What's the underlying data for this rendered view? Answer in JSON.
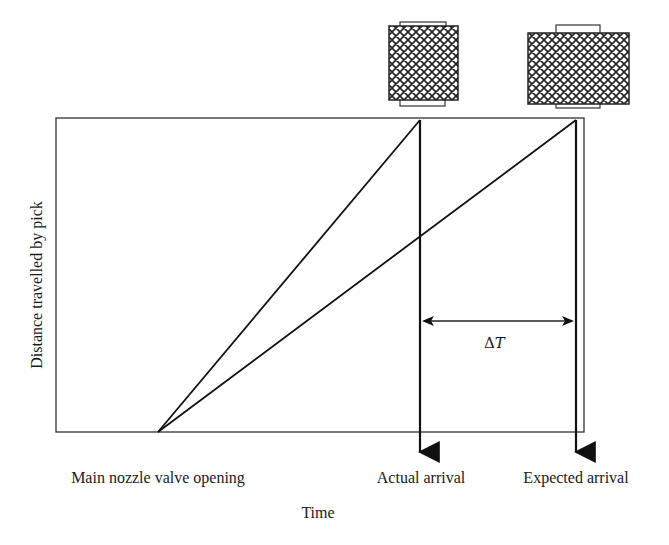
{
  "diagram": {
    "y_axis_label": "Distance travelled by pick",
    "x_axis_label": "Time",
    "events": {
      "start": "Main nozzle valve opening",
      "actual": "Actual arrival",
      "expected": "Expected arrival"
    },
    "interval_label_symbol": "Δ",
    "interval_label_var": "T",
    "lines": [
      {
        "name": "actual-trajectory",
        "from": "Main nozzle valve opening",
        "to": "Actual arrival"
      },
      {
        "name": "expected-trajectory",
        "from": "Main nozzle valve opening",
        "to": "Expected arrival"
      }
    ],
    "objects": [
      {
        "name": "pick-actual",
        "pattern": "crosshatch"
      },
      {
        "name": "pick-expected",
        "pattern": "crosshatch"
      }
    ]
  }
}
